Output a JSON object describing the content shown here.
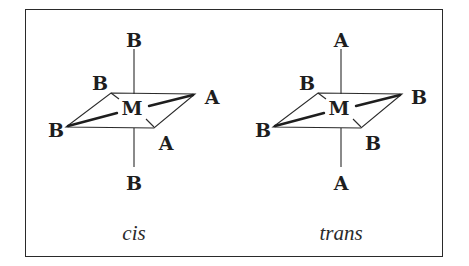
{
  "figure": {
    "colors": {
      "line": "#2a2a2a",
      "text": "#1e1e1e",
      "background": "#ffffff"
    },
    "isomers": [
      {
        "caption": "cis",
        "center": "M",
        "ligands": {
          "top": "B",
          "bottom": "B",
          "back_left": "B",
          "right": "A",
          "left": "B",
          "front": "A"
        }
      },
      {
        "caption": "trans",
        "center": "M",
        "ligands": {
          "top": "A",
          "bottom": "A",
          "back_left": "B",
          "right": "B",
          "left": "B",
          "front": "B"
        }
      }
    ]
  }
}
